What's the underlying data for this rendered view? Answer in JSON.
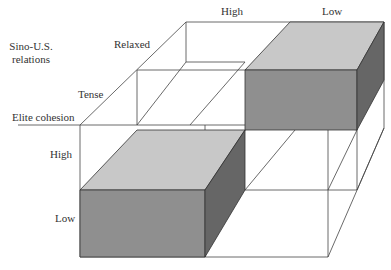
{
  "labels": {
    "axis_sino_us_line1": "Sino-U.S.",
    "axis_sino_us_line2": "relations",
    "relaxed": "Relaxed",
    "tense": "Tense",
    "elite_cohesion": "Elite cohesion",
    "top_high": "High",
    "top_low": "Low",
    "left_high": "High",
    "left_low": "Low"
  },
  "colors": {
    "top_face": "#c8c8c8",
    "front_face": "#8f8f8f",
    "side_face": "#666666",
    "line": "#333333"
  }
}
